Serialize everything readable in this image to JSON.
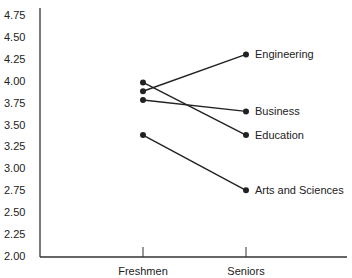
{
  "chart_data": {
    "type": "line",
    "title": "",
    "xlabel": "",
    "ylabel": "",
    "categories": [
      "Freshmen",
      "Seniors"
    ],
    "ylim": [
      2.0,
      4.75
    ],
    "yticks": [
      "4.75",
      "4.50",
      "4.25",
      "4.00",
      "3.75",
      "3.50",
      "3.25",
      "3.00",
      "2.75",
      "2.50",
      "2.25",
      "2.00"
    ],
    "grid": false,
    "legend_position": "direct labels at right end of lines",
    "series": [
      {
        "name": "Engineering",
        "values": [
          3.88,
          4.3
        ]
      },
      {
        "name": "Business",
        "values": [
          3.78,
          3.65
        ]
      },
      {
        "name": "Education",
        "values": [
          3.98,
          3.38
        ]
      },
      {
        "name": "Arts and Sciences",
        "values": [
          3.38,
          2.75
        ]
      }
    ]
  },
  "colors": {
    "line": "#222222",
    "axis": "#333333",
    "text": "#222222"
  }
}
